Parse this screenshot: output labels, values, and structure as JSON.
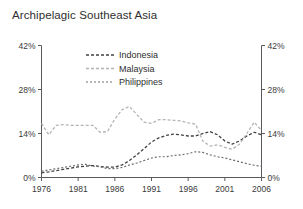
{
  "chart_data": {
    "type": "line",
    "title": "Archipelagic Southeast Asia",
    "xlabel": "",
    "ylabel": "",
    "xlim": [
      1976,
      2006
    ],
    "ylim": [
      0,
      42
    ],
    "grid": false,
    "legend_position": "top-center",
    "y_ticks": [
      "0%",
      "14%",
      "28%",
      "42%"
    ],
    "y_tick_values": [
      0,
      14,
      28,
      42
    ],
    "x_ticks": [
      "1976",
      "1981",
      "1986",
      "1991",
      "1996",
      "2001",
      "2006"
    ],
    "x_tick_values": [
      1976,
      1981,
      1986,
      1991,
      1996,
      2001,
      2006
    ],
    "x": [
      1976,
      1977,
      1978,
      1979,
      1980,
      1981,
      1982,
      1983,
      1984,
      1985,
      1986,
      1987,
      1988,
      1989,
      1990,
      1991,
      1992,
      1993,
      1994,
      1995,
      1996,
      1997,
      1998,
      1999,
      2000,
      2001,
      2002,
      2003,
      2004,
      2005,
      2006
    ],
    "series": [
      {
        "name": "Indonesia",
        "color": "#404040",
        "dash": "3,2",
        "width": 1.3,
        "values": [
          1.5,
          1.8,
          2.2,
          2.6,
          3.0,
          3.4,
          3.6,
          3.8,
          3.5,
          3.3,
          3.3,
          4.0,
          5.4,
          7.2,
          9.2,
          11.3,
          12.6,
          13.4,
          13.8,
          13.6,
          13.2,
          13.2,
          14.0,
          14.6,
          13.6,
          11.6,
          10.6,
          11.6,
          13.2,
          14.4,
          13.6
        ]
      },
      {
        "name": "Malaysia",
        "color": "#b4b4b4",
        "dash": "3,2",
        "width": 1.3,
        "values": [
          17.2,
          13.6,
          16.6,
          16.8,
          16.6,
          16.6,
          16.6,
          16.6,
          14.4,
          14.6,
          18.6,
          21.6,
          22.6,
          20.0,
          17.6,
          17.2,
          18.4,
          18.4,
          18.2,
          18.0,
          17.4,
          17.0,
          11.6,
          10.0,
          10.4,
          9.6,
          9.0,
          10.6,
          14.0,
          17.6,
          15.0
        ]
      },
      {
        "name": "Philippines",
        "color": "#6e6e6e",
        "dash": "2,2",
        "width": 1.2,
        "values": [
          2.0,
          2.4,
          2.8,
          3.2,
          3.6,
          4.0,
          4.2,
          3.6,
          3.4,
          2.8,
          2.8,
          3.2,
          4.0,
          4.6,
          5.4,
          6.2,
          6.6,
          6.6,
          7.0,
          7.2,
          7.6,
          8.2,
          8.0,
          7.2,
          6.6,
          6.2,
          5.6,
          5.0,
          4.4,
          3.9,
          3.6
        ]
      }
    ]
  },
  "legend": {
    "items": [
      {
        "label": "Indonesia"
      },
      {
        "label": "Malaysia"
      },
      {
        "label": "Philippines"
      }
    ]
  }
}
